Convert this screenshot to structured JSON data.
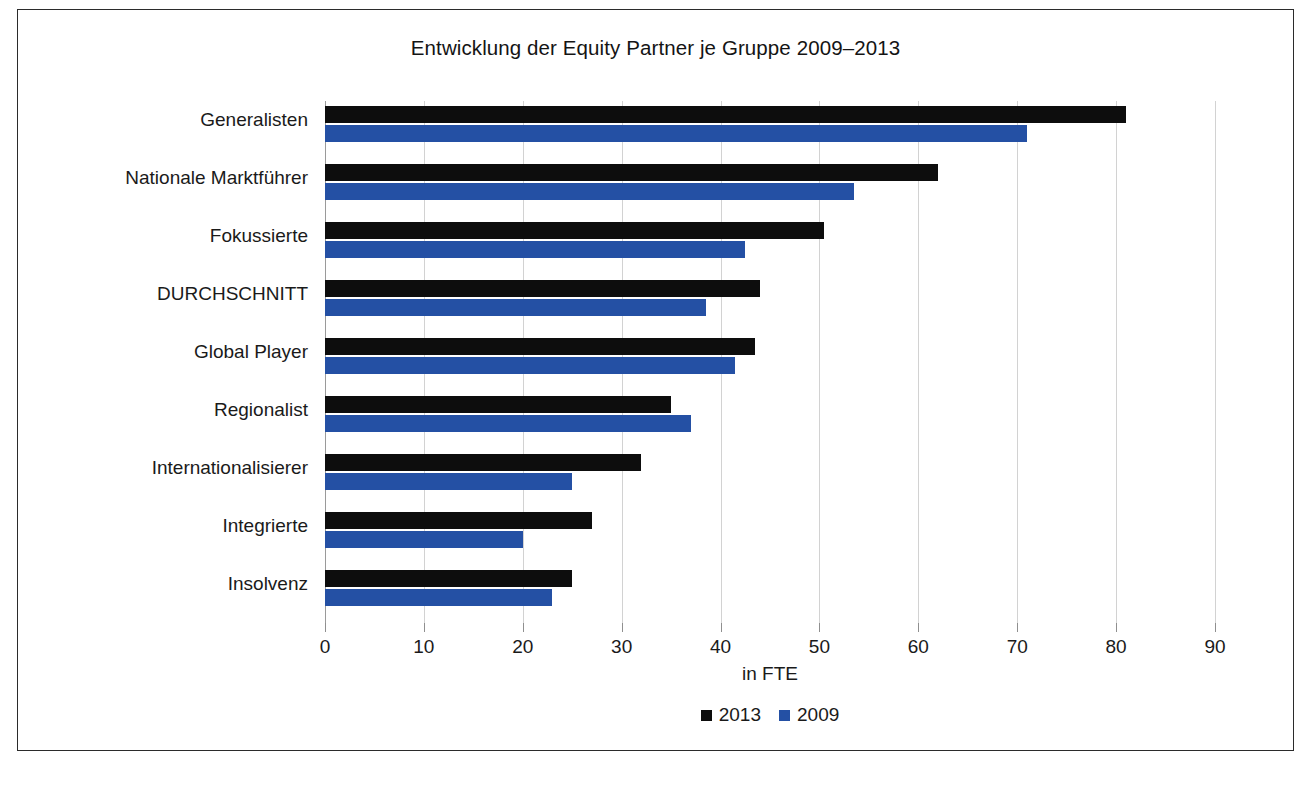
{
  "chart_data": {
    "type": "bar",
    "orientation": "horizontal",
    "title": "Entwicklung der Equity Partner je Gruppe 2009–2013",
    "xlabel": "in FTE",
    "ylabel": "",
    "xlim": [
      0,
      90
    ],
    "xticks": [
      0,
      10,
      20,
      30,
      40,
      50,
      60,
      70,
      80,
      90
    ],
    "xtick_labels": [
      "0",
      "10",
      "20",
      "30",
      "40",
      "50",
      "60",
      "70",
      "80",
      "90"
    ],
    "grid": "vertical",
    "legend_position": "bottom-center",
    "categories": [
      "Generalisten",
      "Nationale Marktführer",
      "Fokussierte",
      "DURCHSCHNITT",
      "Global Player",
      "Regionalist",
      "Internationalisierer",
      "Integrierte",
      "Insolvenz"
    ],
    "series": [
      {
        "name": "2013",
        "color": "#0d0d0d",
        "values": [
          81.0,
          62.0,
          50.5,
          44.0,
          43.5,
          35.0,
          32.0,
          27.0,
          25.0
        ]
      },
      {
        "name": "2009",
        "color": "#2450a4",
        "values": [
          71.0,
          53.5,
          42.5,
          38.5,
          41.5,
          37.0,
          25.0,
          20.0,
          23.0
        ]
      }
    ]
  },
  "legend": {
    "items": [
      {
        "label": "2013",
        "color": "#0d0d0d"
      },
      {
        "label": "2009",
        "color": "#2450a4"
      }
    ]
  },
  "page": {
    "caption": ""
  }
}
